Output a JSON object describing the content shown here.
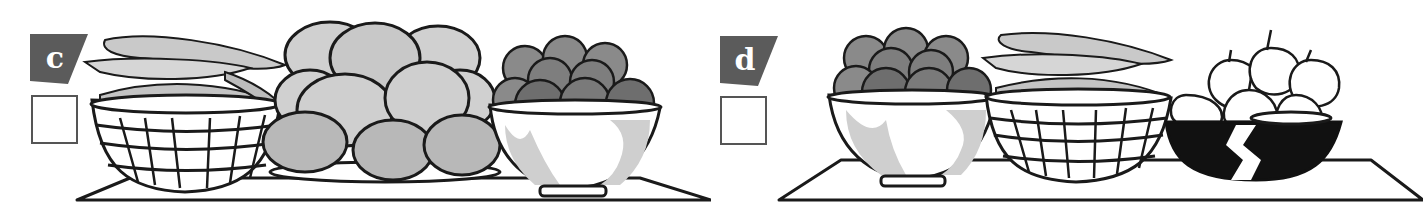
{
  "exercise": {
    "options": [
      {
        "label": "c",
        "checked": false,
        "items": [
          "basket of bananas",
          "plate of mangoes",
          "bowl of apples"
        ]
      },
      {
        "label": "d",
        "checked": false,
        "items": [
          "bowl of apples",
          "basket of bananas",
          "bowl of onions"
        ]
      }
    ]
  },
  "colors": {
    "badge": "#5b5b5b",
    "outline": "#1a1a1a",
    "light_fill": "#d4d4d4",
    "mid_fill": "#a8a8a8",
    "dark_fill": "#6e6e6e"
  }
}
